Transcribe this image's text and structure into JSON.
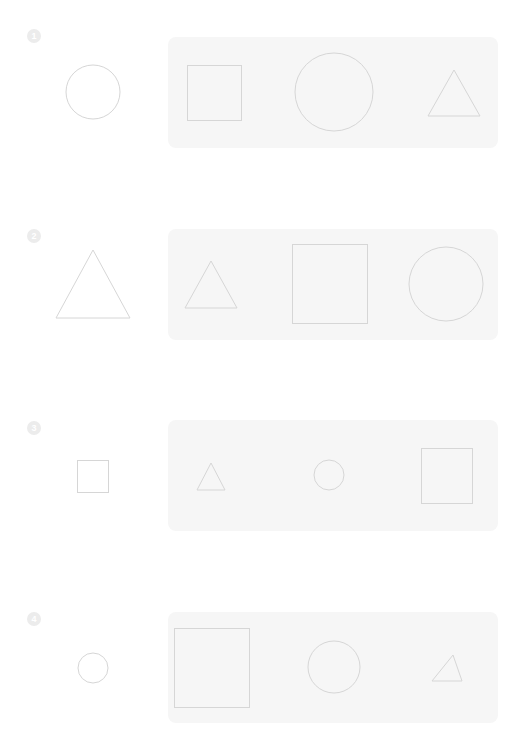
{
  "worksheet": {
    "colors": {
      "background": "#ffffff",
      "panel": "#f6f6f6",
      "stroke": "#d6d6d6",
      "badge": "#ececec"
    },
    "rows": [
      {
        "number": "1",
        "badge": {
          "x": 27,
          "y": 29
        },
        "target": {
          "shape": "circle",
          "cx": 93,
          "cy": 92,
          "r": 27
        },
        "panel": {
          "x": 168,
          "y": 37,
          "w": 330,
          "h": 111
        },
        "options": [
          {
            "shape": "square",
            "x": 187,
            "y": 65,
            "w": 54,
            "h": 55
          },
          {
            "shape": "circle",
            "cx": 334,
            "cy": 92,
            "r": 39
          },
          {
            "shape": "triangle",
            "points": "454,70 428,116 480,116"
          }
        ]
      },
      {
        "number": "2",
        "badge": {
          "x": 27,
          "y": 229
        },
        "target": {
          "shape": "triangle",
          "points": "93,250 56,318 130,318"
        },
        "panel": {
          "x": 168,
          "y": 229,
          "w": 330,
          "h": 111
        },
        "options": [
          {
            "shape": "triangle",
            "points": "211,261 185,308 237,308"
          },
          {
            "shape": "square",
            "x": 292,
            "y": 244,
            "w": 75,
            "h": 79
          },
          {
            "shape": "circle",
            "cx": 446,
            "cy": 284,
            "r": 37
          }
        ]
      },
      {
        "number": "3",
        "badge": {
          "x": 27,
          "y": 421
        },
        "target": {
          "shape": "square",
          "x": 77,
          "y": 460,
          "w": 31,
          "h": 32
        },
        "panel": {
          "x": 168,
          "y": 420,
          "w": 330,
          "h": 111
        },
        "options": [
          {
            "shape": "triangle",
            "points": "211,463 197,490 225,490"
          },
          {
            "shape": "circle",
            "cx": 329,
            "cy": 475,
            "r": 15
          },
          {
            "shape": "square",
            "x": 421,
            "y": 448,
            "w": 51,
            "h": 55
          }
        ]
      },
      {
        "number": "4",
        "badge": {
          "x": 27,
          "y": 612
        },
        "target": {
          "shape": "circle",
          "cx": 93,
          "cy": 668,
          "r": 15
        },
        "panel": {
          "x": 168,
          "y": 612,
          "w": 330,
          "h": 111
        },
        "options": [
          {
            "shape": "square",
            "x": 174,
            "y": 628,
            "w": 75,
            "h": 79
          },
          {
            "shape": "circle",
            "cx": 334,
            "cy": 667,
            "r": 26
          },
          {
            "shape": "triangle",
            "points": "453,655 432,681 462,681"
          }
        ]
      }
    ]
  }
}
